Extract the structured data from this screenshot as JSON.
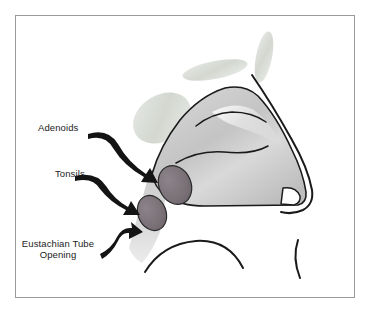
{
  "figure": {
    "frame_color": "#9a9a9a",
    "background_color": "#ffffff"
  },
  "labels": [
    {
      "id": "adenoids",
      "text": "Adenoids",
      "target": "adenoid-mass"
    },
    {
      "id": "tonsils",
      "text": "Tonsils",
      "target": "tonsil-mass"
    },
    {
      "id": "eustachian",
      "text": "Eustachian Tube\nOpening",
      "target": "eustachian-tube-opening"
    }
  ],
  "anatomy": {
    "nasal_cavity_fill": "#c9c9c9",
    "sinus_fill": "#d5d8d1",
    "adenoid_fill": "#7a7076",
    "tonsil_fill": "#7a7076",
    "outline_color": "#1a1a1a",
    "parts": [
      "nasal-cavity",
      "turbinate-upper",
      "turbinate-lower",
      "sinus-blob-left",
      "sinus-blob-middle",
      "sinus-blob-right",
      "nose-profile",
      "adenoid-mass",
      "tonsil-mass",
      "pharyngeal-wall",
      "tongue-curve",
      "lip-curve",
      "nostril"
    ]
  },
  "arrows": {
    "color": "#141414",
    "count": 3
  }
}
